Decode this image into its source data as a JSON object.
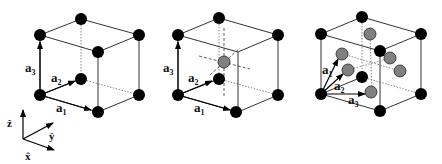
{
  "figure": {
    "panels": [
      {
        "name": "simple-cubic",
        "vectors": [
          {
            "base": "a",
            "sub": "1"
          },
          {
            "base": "a",
            "sub": "2"
          },
          {
            "base": "a",
            "sub": "3"
          }
        ]
      },
      {
        "name": "body-centered-cubic",
        "vectors": [
          {
            "base": "a",
            "sub": "1"
          },
          {
            "base": "a",
            "sub": "2"
          },
          {
            "base": "a",
            "sub": "3"
          }
        ]
      },
      {
        "name": "face-centered-cubic",
        "vectors": [
          {
            "base": "a",
            "sub": "1"
          },
          {
            "base": "a",
            "sub": "2"
          },
          {
            "base": "a",
            "sub": "3"
          }
        ]
      }
    ],
    "axes": {
      "z": "ẑ",
      "y": "ŷ",
      "x": "x̂"
    },
    "colors": {
      "corner_atom": "#000000",
      "extra_atom": "#808080"
    }
  }
}
